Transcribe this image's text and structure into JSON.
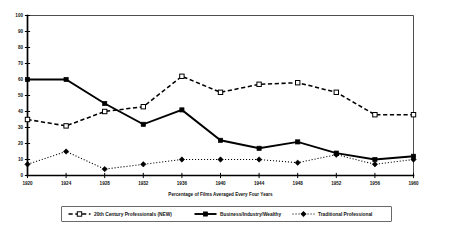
{
  "chart_data": {
    "type": "line",
    "title": "",
    "subtitle": "",
    "xlabel": "Percentage of Films Averaged Every Four Years",
    "ylabel": "",
    "x": [
      1920,
      1924,
      1928,
      1932,
      1936,
      1940,
      1944,
      1948,
      1952,
      1956,
      1960
    ],
    "xticklabels": [
      "1920",
      "1924",
      "1928",
      "1932",
      "1936",
      "1940",
      "1944",
      "1948",
      "1952",
      "1956",
      "1960"
    ],
    "yticklabels": [
      "0",
      "10",
      "20",
      "30",
      "40",
      "50",
      "60",
      "70",
      "80",
      "90",
      "100"
    ],
    "ylim": [
      0,
      100
    ],
    "xlim": [
      1920,
      1960
    ],
    "grid": false,
    "legend_position": "bottom",
    "series": [
      {
        "name": "20th Century Professionals (NEW)",
        "marker": "open-square",
        "linestyle": "dashed",
        "color": "#000000",
        "values": [
          35,
          31,
          40,
          43,
          62,
          52,
          57,
          58,
          52,
          38,
          38
        ]
      },
      {
        "name": "Business/Industry/Wealthy",
        "marker": "filled-square",
        "linestyle": "solid",
        "color": "#000000",
        "values": [
          60,
          60,
          45,
          32,
          41,
          22,
          17,
          21,
          14,
          10,
          12
        ]
      },
      {
        "name": "Traditional Professional",
        "marker": "filled-diamond",
        "linestyle": "dotted",
        "color": "#000000",
        "values": [
          7,
          15,
          4,
          7,
          10,
          10,
          10,
          8,
          13,
          7,
          10
        ]
      }
    ]
  },
  "legend": {
    "entries": [
      {
        "label": "20th Century Professionals (NEW)"
      },
      {
        "label": "Business/Industry/Wealthy"
      },
      {
        "label": "Traditional Professional"
      }
    ]
  },
  "axes": {
    "x_title": "Percentage of Films Averaged Every Four Years"
  }
}
